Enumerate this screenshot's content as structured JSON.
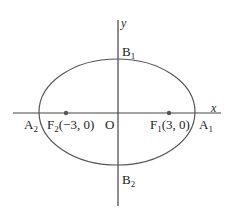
{
  "diagram": {
    "type": "ellipse",
    "axes": {
      "x_label": "x",
      "y_label": "y"
    },
    "origin_label": "O",
    "vertices": {
      "A1": {
        "base": "A",
        "sub": "1"
      },
      "A2": {
        "base": "A",
        "sub": "2"
      },
      "B1": {
        "base": "B",
        "sub": "1"
      },
      "B2": {
        "base": "B",
        "sub": "2"
      }
    },
    "foci": {
      "F1": {
        "base": "F",
        "sub": "1",
        "coords": "(3, 0)"
      },
      "F2": {
        "base": "F",
        "sub": "2",
        "coords": "(−3, 0)"
      }
    },
    "colors": {
      "stroke": "#555555",
      "text": "#222222"
    }
  }
}
